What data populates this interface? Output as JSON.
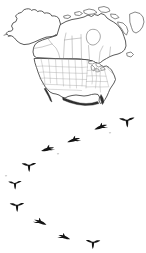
{
  "image": {
    "title": "North American goose migration",
    "subject": "Line-art map of North America with a V formation flock of Canada geese",
    "background_color": "#ffffff",
    "width": 146,
    "height": 253
  },
  "watermark": {
    "text": "",
    "color": "#efefef",
    "position": "top-right"
  },
  "map": {
    "name": "north-america-outline-map",
    "style": "black and white line drawing",
    "outline_color": "#3d3d3d",
    "border_color": "#8a8a8a",
    "fill_color": "#ffffff",
    "regions": [
      {
        "name": "Alaska",
        "label": ""
      },
      {
        "name": "Canada",
        "label": ""
      },
      {
        "name": "Greenland",
        "label": ""
      },
      {
        "name": "United States",
        "label": ""
      },
      {
        "name": "Mexico",
        "label": ""
      }
    ],
    "features": [
      "state borders",
      "provincial borders",
      "Great Lakes",
      "Hudson Bay",
      "Baja California",
      "Florida peninsula"
    ]
  },
  "flock": {
    "name": "goose-flock",
    "species": "Canada geese",
    "formation": "V formation",
    "count": 13,
    "silhouette_color": "#141414",
    "birds": [
      {
        "id": 1,
        "x": 127,
        "y": 121,
        "size": 15,
        "pose": "front",
        "rot": -4
      },
      {
        "id": 2,
        "x": 101,
        "y": 126,
        "size": 14,
        "pose": "glide",
        "rot": -10
      },
      {
        "id": 3,
        "x": 74,
        "y": 139,
        "size": 14,
        "pose": "glide",
        "rot": -8
      },
      {
        "id": 4,
        "x": 48,
        "y": 148,
        "size": 14,
        "pose": "glide",
        "rot": -6
      },
      {
        "id": 5,
        "x": 29,
        "y": 166,
        "size": 14,
        "pose": "front",
        "rot": -2
      },
      {
        "id": 6,
        "x": 15,
        "y": 184,
        "size": 13,
        "pose": "front",
        "rot": -2
      },
      {
        "id": 7,
        "x": 17,
        "y": 206,
        "size": 14,
        "pose": "front",
        "rot": -2
      },
      {
        "id": 8,
        "x": 40,
        "y": 221,
        "size": 14,
        "pose": "glide",
        "rot": 12
      },
      {
        "id": 9,
        "x": 64,
        "y": 236,
        "size": 13,
        "pose": "glide",
        "rot": 10
      },
      {
        "id": 10,
        "x": 93,
        "y": 243,
        "size": 14,
        "pose": "front",
        "rot": 2
      },
      {
        "id": 11,
        "x": 110,
        "y": 133,
        "size": 6,
        "pose": "far",
        "rot": 0
      },
      {
        "id": 12,
        "x": 58,
        "y": 154,
        "size": 6,
        "pose": "far",
        "rot": 0
      },
      {
        "id": 13,
        "x": 6,
        "y": 176,
        "size": 6,
        "pose": "far",
        "rot": 0
      }
    ]
  }
}
